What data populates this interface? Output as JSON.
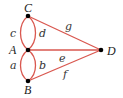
{
  "diagram": {
    "type": "multigraph",
    "colors": {
      "edge": "#d9574f",
      "node": "#000000",
      "label": "#333333"
    },
    "nodes": [
      {
        "id": "C",
        "label": "C",
        "x": 28,
        "y": 16
      },
      {
        "id": "A",
        "label": "A",
        "x": 28,
        "y": 50
      },
      {
        "id": "B",
        "label": "B",
        "x": 28,
        "y": 81
      },
      {
        "id": "D",
        "label": "D",
        "x": 101,
        "y": 50
      }
    ],
    "edges": [
      {
        "id": "c",
        "label": "c",
        "from": "C",
        "to": "A",
        "shape": "curve-left"
      },
      {
        "id": "d",
        "label": "d",
        "from": "C",
        "to": "A",
        "shape": "curve-right"
      },
      {
        "id": "a",
        "label": "a",
        "from": "A",
        "to": "B",
        "shape": "curve-left"
      },
      {
        "id": "b",
        "label": "b",
        "from": "A",
        "to": "B",
        "shape": "curve-right"
      },
      {
        "id": "g",
        "label": "g",
        "from": "C",
        "to": "D",
        "shape": "straight"
      },
      {
        "id": "e",
        "label": "e",
        "from": "A",
        "to": "D",
        "shape": "straight"
      },
      {
        "id": "f",
        "label": "f",
        "from": "B",
        "to": "D",
        "shape": "straight"
      }
    ]
  }
}
